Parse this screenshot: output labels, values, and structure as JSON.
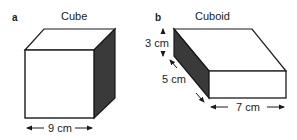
{
  "panels": [
    {
      "letter": "a",
      "title": "Cube",
      "dimensions": {
        "width": "9 cm"
      }
    },
    {
      "letter": "b",
      "title": "Cuboid",
      "dimensions": {
        "height": "3 cm",
        "depth": "5 cm",
        "length": "7 cm"
      }
    }
  ],
  "colors": {
    "line": "#1a1a1a",
    "shade": "#3a3a3a",
    "face": "#ffffff"
  }
}
